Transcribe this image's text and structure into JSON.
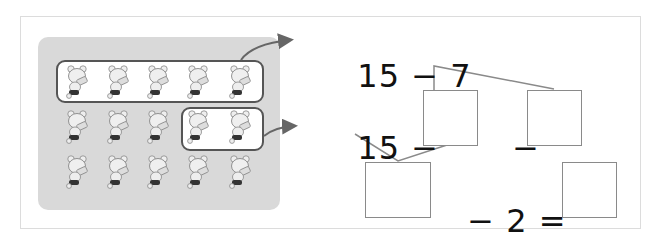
{
  "picture": {
    "rows": [
      {
        "count": 5
      },
      {
        "count": 5
      },
      {
        "count": 5
      }
    ],
    "total_bears": 15,
    "grouped_first": 5,
    "grouped_second": 2,
    "icon": "bear-icon"
  },
  "equations": {
    "line1": {
      "left": "15",
      "op": "−",
      "right": "7"
    },
    "line2": {
      "left": "15",
      "op1": "−",
      "op2": "−"
    },
    "line3": {
      "op": "−",
      "value": "2",
      "equals": "="
    }
  },
  "answer_boxes": [
    {
      "id": "box-split-first",
      "value": ""
    },
    {
      "id": "box-split-second",
      "value": ""
    },
    {
      "id": "box-intermediate",
      "value": ""
    },
    {
      "id": "box-result",
      "value": ""
    }
  ],
  "colors": {
    "panel": "#d9d9d9",
    "line": "#8a8a8a",
    "arrow": "#666666"
  }
}
